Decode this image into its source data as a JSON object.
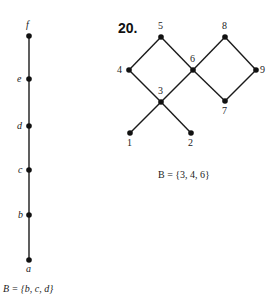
{
  "left_diagram": {
    "type": "chain",
    "vertices": [
      {
        "label": "f",
        "x": 29,
        "y": 36
      },
      {
        "label": "e",
        "x": 29,
        "y": 79
      },
      {
        "label": "d",
        "x": 29,
        "y": 126
      },
      {
        "label": "c",
        "x": 29,
        "y": 170
      },
      {
        "label": "b",
        "x": 29,
        "y": 215
      },
      {
        "label": "a",
        "x": 29,
        "y": 260
      }
    ],
    "edges": [
      [
        "a",
        "b"
      ],
      [
        "b",
        "c"
      ],
      [
        "c",
        "d"
      ],
      [
        "d",
        "e"
      ],
      [
        "e",
        "f"
      ]
    ],
    "caption": "B = {b, c, d}"
  },
  "right_diagram": {
    "problem_number": "20.",
    "vertices": [
      {
        "label": "5",
        "x": 161,
        "y": 37
      },
      {
        "label": "8",
        "x": 225,
        "y": 37
      },
      {
        "label": "4",
        "x": 129,
        "y": 70
      },
      {
        "label": "6",
        "x": 193,
        "y": 70
      },
      {
        "label": "9",
        "x": 256,
        "y": 70
      },
      {
        "label": "3",
        "x": 161,
        "y": 102
      },
      {
        "label": "7",
        "x": 225,
        "y": 101
      },
      {
        "label": "1",
        "x": 130,
        "y": 133
      },
      {
        "label": "2",
        "x": 191,
        "y": 133
      }
    ],
    "edges": [
      [
        "4",
        "5"
      ],
      [
        "5",
        "6"
      ],
      [
        "4",
        "3"
      ],
      [
        "3",
        "6"
      ],
      [
        "6",
        "8"
      ],
      [
        "8",
        "9"
      ],
      [
        "6",
        "7"
      ],
      [
        "7",
        "9"
      ],
      [
        "1",
        "3"
      ],
      [
        "3",
        "2"
      ]
    ],
    "caption": "B = {3, 4, 6}"
  }
}
